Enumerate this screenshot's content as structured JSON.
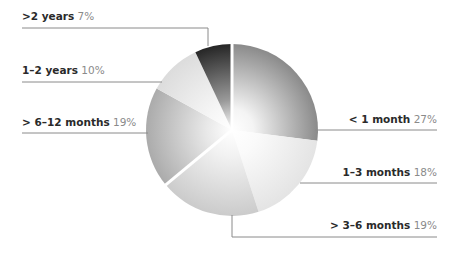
{
  "chart_data": {
    "type": "pie",
    "title": "",
    "categories": [
      "< 1 month",
      "1–3 months",
      "> 3–6 months",
      "> 6–12 months",
      "1–2 years",
      ">2 years"
    ],
    "values": [
      27,
      18,
      19,
      19,
      10,
      7
    ],
    "unit": "%",
    "start_angle_deg": 0,
    "direction": "clockwise",
    "legend_position": "callout-labels",
    "slices": [
      {
        "label": "< 1 month",
        "value": 27,
        "pct_text": "27%",
        "color": "#8c8c8c",
        "side": "right",
        "text_y": 120,
        "line_y": 130
      },
      {
        "label": "1–3 months",
        "value": 18,
        "pct_text": "18%",
        "color": "#e6e6e6",
        "side": "right",
        "text_y": 173,
        "line_y": 183
      },
      {
        "label": "> 3–6 months",
        "value": 19,
        "pct_text": "19%",
        "color": "#cdcdcd",
        "side": "right",
        "text_y": 225,
        "line_y": 237
      },
      {
        "label": "> 6–12 months",
        "value": 19,
        "pct_text": "19%",
        "color": "#adadad",
        "side": "left",
        "text_y": 121,
        "line_y": 133
      },
      {
        "label": "1–2 years",
        "value": 10,
        "pct_text": "10%",
        "color": "#dedede",
        "side": "left",
        "text_y": 69,
        "line_y": 82
      },
      {
        "label": ">2 years",
        "value": 7,
        "pct_text": "7%",
        "color": "#2e2e2e",
        "side": "left",
        "text_y": 16,
        "line_y": 28
      }
    ]
  },
  "labels": {
    "s0": {
      "name": "< 1 month",
      "pct": "27%"
    },
    "s1": {
      "name": "1–3 months",
      "pct": "18%"
    },
    "s2": {
      "name": "> 3–6 months",
      "pct": "19%"
    },
    "s3": {
      "name": "> 6–12 months",
      "pct": "19%"
    },
    "s4": {
      "name": "1–2 years",
      "pct": "10%"
    },
    "s5": {
      "name": ">2 years",
      "pct": "7%"
    }
  }
}
